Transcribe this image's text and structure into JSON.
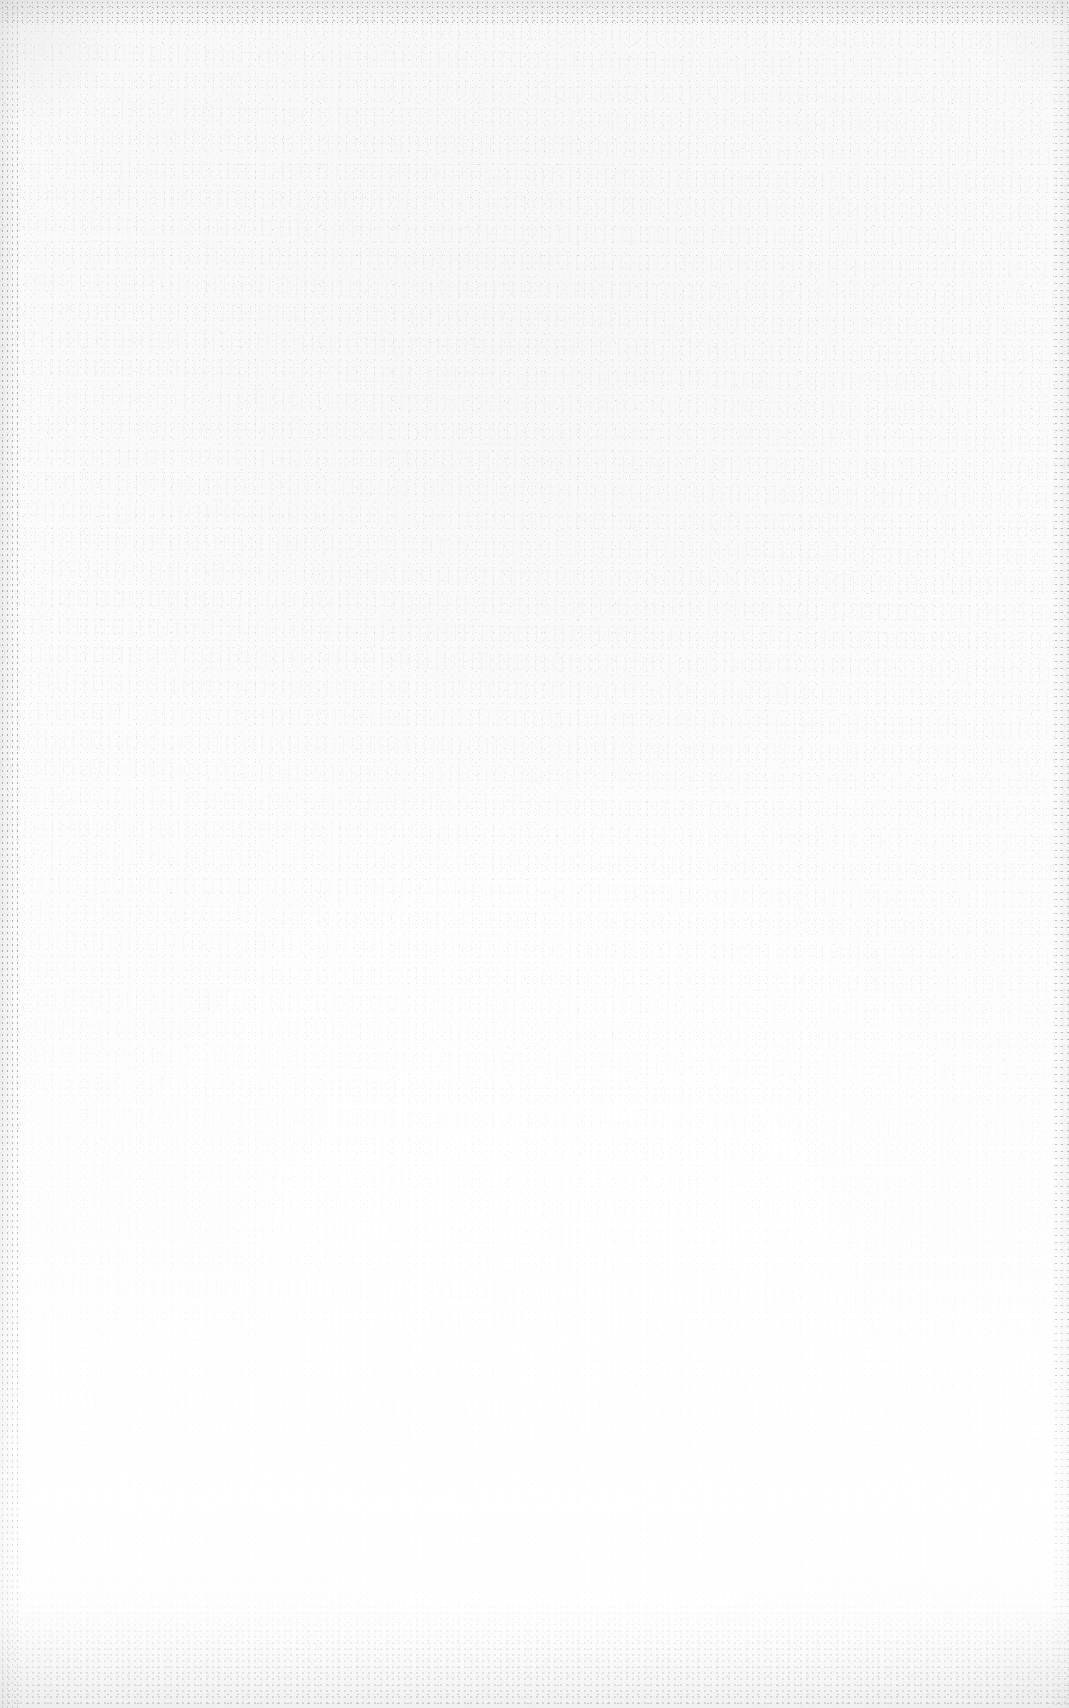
{
  "page": {
    "kind": "blank-scanned-page",
    "width": 1069,
    "height": 1708,
    "text_content": "",
    "has_text": false,
    "has_graphics": false
  },
  "appearance": {
    "paper_color": "#fcfcfc",
    "paper_color_top": "#f9f9f9",
    "paper_color_bottom": "#ffffff",
    "speck_color": "#9a9a9a",
    "edge_shadow_color": "#c8c8c8",
    "grain_note": "Noise density highest across the upper region and fading toward the lower region.",
    "edges": {
      "top_band_px": 26,
      "bottom_band_px": 110,
      "left_band_px": 18,
      "right_band_px": 16
    }
  }
}
